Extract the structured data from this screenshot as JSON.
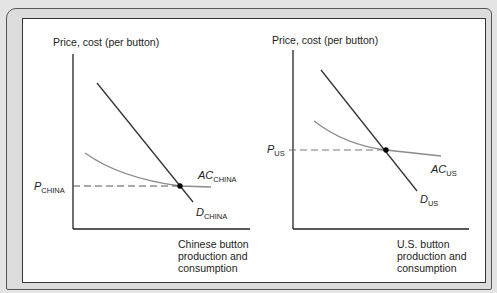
{
  "panels": {
    "china": {
      "y_axis_label": "Price, cost (per button)",
      "x_axis_label": "Chinese button production and consumption",
      "price_label": "P",
      "price_sub": "CHINA",
      "ac_label": "AC",
      "ac_sub": "CHINA",
      "d_label": "D",
      "d_sub": "CHINA"
    },
    "us": {
      "y_axis_label": "Price, cost (per button)",
      "x_axis_label": "U.S. button production and consumption",
      "price_label": "P",
      "price_sub": "US",
      "ac_label": "AC",
      "ac_sub": "US",
      "d_label": "D",
      "d_sub": "US"
    }
  },
  "colors": {
    "demand_line": "#333333",
    "ac_curve": "#8a8a8a",
    "axis": "#222222",
    "dashed": "#555555"
  }
}
